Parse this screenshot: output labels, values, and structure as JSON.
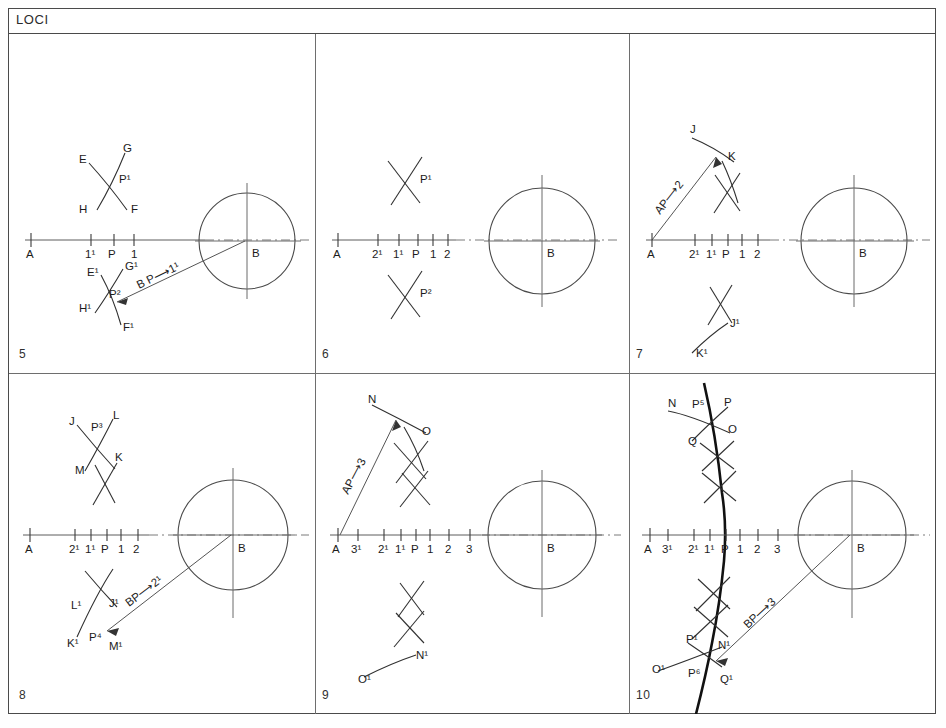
{
  "sheet": {
    "title": "LOCI",
    "background_color": "#ffffff",
    "frame_color": "#4a4a4a",
    "line_color": "#303030",
    "locus_color": "#111111"
  },
  "panels": [
    {
      "number": "5",
      "axis_labels": [
        "A",
        "1¹",
        "P",
        "1"
      ],
      "center_label": "B",
      "upper_arc_labels": [
        "E",
        "G",
        "P¹",
        "H",
        "F"
      ],
      "lower_arc_labels": [
        "E¹",
        "G¹",
        "P²",
        "H¹",
        "F¹"
      ],
      "annotation": "B P⟶1¹",
      "has_circle": true,
      "has_ray": true,
      "has_locus": false
    },
    {
      "number": "6",
      "axis_labels": [
        "A",
        "2¹",
        "1¹",
        "P",
        "1",
        "2"
      ],
      "center_label": "B",
      "upper_arc_labels": [
        "P¹"
      ],
      "lower_arc_labels": [
        "P²"
      ],
      "annotation": "",
      "has_circle": true,
      "has_ray": false,
      "has_locus": false
    },
    {
      "number": "7",
      "axis_labels": [
        "A",
        "2¹",
        "1¹",
        "P",
        "1",
        "2"
      ],
      "center_label": "B",
      "upper_arc_labels": [
        "J",
        "K"
      ],
      "lower_arc_labels": [
        "J¹",
        "K¹"
      ],
      "annotation": "AP⟶2",
      "has_circle": true,
      "has_ray": true,
      "has_locus": false
    },
    {
      "number": "8",
      "axis_labels": [
        "A",
        "2¹",
        "1¹",
        "P",
        "1",
        "2"
      ],
      "center_label": "B",
      "upper_arc_labels": [
        "J",
        "P³",
        "L",
        "M",
        "K"
      ],
      "lower_arc_labels": [
        "L¹",
        "J¹",
        "K¹",
        "P⁴",
        "M¹"
      ],
      "annotation": "BP⟶2¹",
      "has_circle": true,
      "has_ray": true,
      "has_locus": false
    },
    {
      "number": "9",
      "axis_labels": [
        "A",
        "3¹",
        "2¹",
        "1¹",
        "P",
        "1",
        "2",
        "3"
      ],
      "center_label": "B",
      "upper_arc_labels": [
        "N",
        "O"
      ],
      "lower_arc_labels": [
        "N¹",
        "O¹"
      ],
      "annotation": "AP⟶3",
      "has_circle": true,
      "has_ray": true,
      "has_locus": false
    },
    {
      "number": "10",
      "axis_labels": [
        "A",
        "3¹",
        "2¹",
        "1¹",
        "P",
        "1",
        "2",
        "3"
      ],
      "center_label": "B",
      "upper_arc_labels": [
        "N",
        "P⁵",
        "P",
        "Q",
        "O"
      ],
      "lower_arc_labels": [
        "P¹",
        "N¹",
        "O¹",
        "P⁶",
        "Q¹"
      ],
      "annotation": "BP⟶3",
      "has_circle": true,
      "has_ray": true,
      "has_locus": true
    }
  ],
  "p5": {
    "ax_A": "A",
    "ax_1p": "1¹",
    "ax_P": "P",
    "ax_1": "1",
    "ax_B": "B",
    "E": "E",
    "G": "G",
    "P1": "P¹",
    "H": "H",
    "F": "F",
    "Ep": "E¹",
    "Gp": "G¹",
    "P2": "P²",
    "Hp": "H¹",
    "Fp": "F¹",
    "note": "B P⟶1¹",
    "num": "5"
  },
  "p6": {
    "ax_A": "A",
    "ax_2p": "2¹",
    "ax_1p": "1¹",
    "ax_P": "P",
    "ax_1": "1",
    "ax_2": "2",
    "ax_B": "B",
    "P1": "P¹",
    "P2": "P²",
    "num": "6"
  },
  "p7": {
    "ax_A": "A",
    "ax_2p": "2¹",
    "ax_1p": "1¹",
    "ax_P": "P",
    "ax_1": "1",
    "ax_2": "2",
    "ax_B": "B",
    "J": "J",
    "K": "K",
    "Jp": "J¹",
    "Kp": "K¹",
    "note": "AP⟶2",
    "num": "7"
  },
  "p8": {
    "ax_A": "A",
    "ax_2p": "2¹",
    "ax_1p": "1¹",
    "ax_P": "P",
    "ax_1": "1",
    "ax_2": "2",
    "ax_B": "B",
    "J": "J",
    "P3": "P³",
    "L": "L",
    "M": "M",
    "K": "K",
    "Lp": "L¹",
    "Jp": "J¹",
    "Kp": "K¹",
    "P4": "P⁴",
    "Mp": "M¹",
    "note": "BP⟶2¹",
    "num": "8"
  },
  "p9": {
    "ax_A": "A",
    "ax_3p": "3¹",
    "ax_2p": "2¹",
    "ax_1p": "1¹",
    "ax_P": "P",
    "ax_1": "1",
    "ax_2": "2",
    "ax_3": "3",
    "ax_B": "B",
    "N": "N",
    "O": "O",
    "Np": "N¹",
    "Op": "O¹",
    "note": "AP⟶3",
    "num": "9"
  },
  "p10": {
    "ax_A": "A",
    "ax_3p": "3¹",
    "ax_2p": "2¹",
    "ax_1p": "1¹",
    "ax_P": "P",
    "ax_1": "1",
    "ax_2": "2",
    "ax_3": "3",
    "ax_B": "B",
    "N": "N",
    "P5": "P⁵",
    "Ptop": "P",
    "Q": "Q",
    "O": "O",
    "P1": "P¹",
    "Np": "N¹",
    "Op": "O¹",
    "P6": "P⁶",
    "Qp": "Q¹",
    "note": "BP⟶3",
    "num": "10"
  }
}
